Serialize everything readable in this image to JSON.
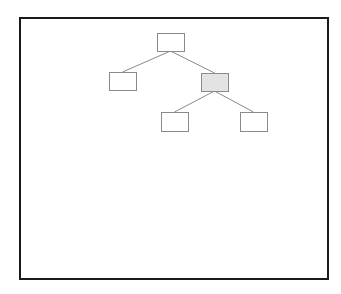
{
  "diagram": {
    "type": "tree",
    "frame": {
      "x": 19,
      "y": 17,
      "width": 308,
      "height": 261,
      "border_color": "#1a1a1a"
    },
    "node_style": {
      "stroke": "#8a8a8a",
      "fill": "#ffffff",
      "highlight_fill": "#e3e3e3",
      "label": ""
    },
    "edge_color": "#8a8a8a",
    "nodes": [
      {
        "id": "root",
        "x": 157,
        "y": 33,
        "w": 27,
        "h": 18,
        "highlighted": false,
        "label": ""
      },
      {
        "id": "left-child",
        "x": 109,
        "y": 72,
        "w": 27,
        "h": 18,
        "highlighted": false,
        "label": ""
      },
      {
        "id": "right-child",
        "x": 201,
        "y": 73,
        "w": 27,
        "h": 18,
        "highlighted": true,
        "label": ""
      },
      {
        "id": "grandchild-left",
        "x": 161,
        "y": 112,
        "w": 27,
        "h": 19,
        "highlighted": false,
        "label": ""
      },
      {
        "id": "grandchild-right",
        "x": 240,
        "y": 112,
        "w": 27,
        "h": 19,
        "highlighted": false,
        "label": ""
      }
    ],
    "edges": [
      {
        "from": "root",
        "to": "left-child"
      },
      {
        "from": "root",
        "to": "right-child"
      },
      {
        "from": "right-child",
        "to": "grandchild-left"
      },
      {
        "from": "right-child",
        "to": "grandchild-right"
      }
    ]
  }
}
